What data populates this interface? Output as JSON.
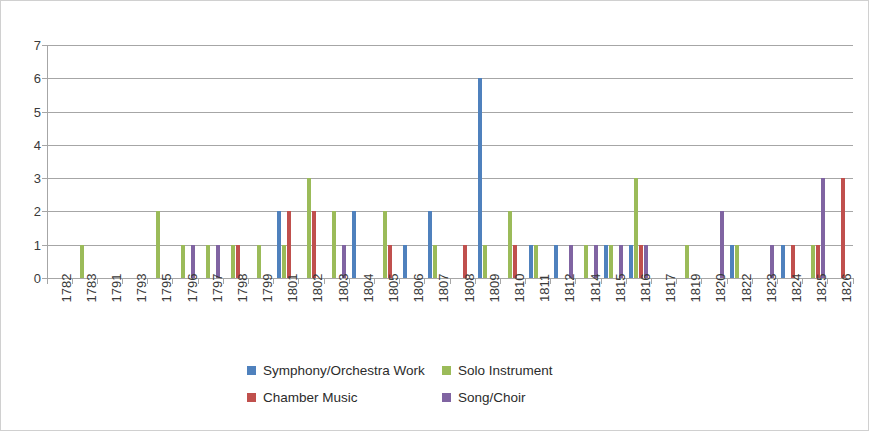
{
  "chart_data": {
    "type": "bar",
    "title": "",
    "xlabel": "",
    "ylabel": "",
    "ylim": [
      0,
      7
    ],
    "y_ticks": [
      0,
      1,
      2,
      3,
      4,
      5,
      6,
      7
    ],
    "grid": true,
    "legend_position": "bottom",
    "categories": [
      "1782",
      "1783",
      "1791",
      "1793",
      "1795",
      "1796",
      "1797",
      "1798",
      "1799",
      "1801",
      "1802",
      "1803",
      "1804",
      "1805",
      "1806",
      "1807",
      "1808",
      "1809",
      "1810",
      "1811",
      "1812",
      "1814",
      "1815",
      "1816",
      "1817",
      "1819",
      "1820",
      "1822",
      "1823",
      "1824",
      "1825",
      "1826"
    ],
    "series": [
      {
        "name": "Symphony/Orchestra Work",
        "color": "#4f81bd",
        "values": [
          0,
          0,
          0,
          0,
          0,
          0,
          0,
          0,
          0,
          2,
          0,
          0,
          2,
          0,
          1,
          2,
          0,
          6,
          0,
          1,
          1,
          0,
          1,
          1,
          0,
          0,
          0,
          1,
          0,
          1,
          0,
          0
        ]
      },
      {
        "name": "Solo Instrument",
        "color": "#9bbb59",
        "values": [
          0,
          1,
          0,
          0,
          2,
          1,
          1,
          1,
          1,
          1,
          3,
          2,
          0,
          2,
          0,
          1,
          0,
          1,
          2,
          1,
          0,
          1,
          1,
          3,
          0,
          1,
          0,
          1,
          0,
          0,
          1,
          0
        ]
      },
      {
        "name": "Chamber Music",
        "color": "#c0504d",
        "values": [
          0,
          0,
          0,
          0,
          0,
          0,
          0,
          1,
          0,
          2,
          2,
          0,
          0,
          1,
          0,
          0,
          1,
          0,
          1,
          0,
          0,
          0,
          0,
          1,
          0,
          0,
          0,
          0,
          0,
          1,
          1,
          3
        ]
      },
      {
        "name": "Song/Choir",
        "color": "#8064a2",
        "values": [
          0,
          0,
          0,
          0,
          0,
          1,
          1,
          0,
          0,
          0,
          0,
          1,
          0,
          0,
          0,
          0,
          0,
          0,
          0,
          0,
          1,
          1,
          1,
          1,
          0,
          0,
          2,
          0,
          1,
          0,
          3,
          0
        ]
      }
    ]
  }
}
